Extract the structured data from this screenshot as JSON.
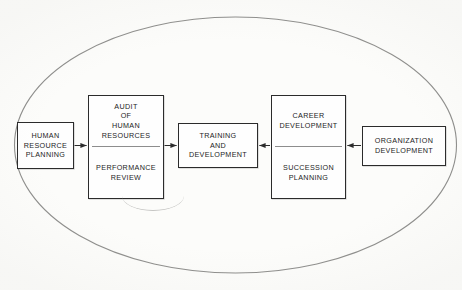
{
  "diagram": {
    "title_visible": false,
    "container_shape": "ellipse",
    "colors": {
      "paper": "#fdfdfb",
      "ink": "#1d1d1d",
      "box_border": "#2b2b2b",
      "divider": "#8d8d8d",
      "ellipse": "#8e8e8c",
      "arrow": "#2b2b2b"
    },
    "nodes": [
      {
        "id": "human-resource-planning",
        "lines": [
          "HUMAN",
          "RESOURCE",
          "PLANNING"
        ],
        "split": false
      },
      {
        "id": "audit-of-human-resources",
        "split": true,
        "top_lines": [
          "AUDIT",
          "OF",
          "HUMAN",
          "RESOURCES"
        ],
        "bottom_lines": [
          "PERFORMANCE",
          "REVIEW"
        ]
      },
      {
        "id": "training-and-development",
        "lines": [
          "TRAINING",
          "AND",
          "DEVELOPMENT"
        ],
        "split": false
      },
      {
        "id": "career-development",
        "split": true,
        "top_lines": [
          "CAREER",
          "DEVELOPMENT"
        ],
        "bottom_lines": [
          "SUCCESSION",
          "PLANNING"
        ]
      },
      {
        "id": "organization-development",
        "lines": [
          "ORGANIZATION",
          "DEVELOPMENT"
        ],
        "split": false
      }
    ],
    "arrows": [
      {
        "id": "hrp-to-audit",
        "direction": "right"
      },
      {
        "id": "audit-to-training",
        "direction": "right"
      },
      {
        "id": "career-to-training",
        "direction": "left"
      },
      {
        "id": "orgdev-to-career",
        "direction": "left"
      }
    ]
  }
}
